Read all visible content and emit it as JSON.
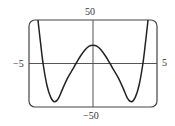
{
  "chart_data": {
    "type": "line",
    "title": "",
    "xlabel": "",
    "ylabel": "",
    "xlim": [
      -5,
      5
    ],
    "ylim": [
      -50,
      50
    ],
    "grid": false,
    "legend": null,
    "tick_labels": {
      "x_min": "−5",
      "x_max": "5",
      "y_max": "50",
      "y_min": "−50"
    },
    "series": [
      {
        "name": "f(x)",
        "description": "Symmetric W-shaped (quartic-like) curve: local max ≈ 21 at x=0, minima ≈ −44 at x≈±3, zeros ≈ ±1.3 and ±3.9, exits top of window near x≈±4.3",
        "x": [
          -4.3,
          -4.1,
          -3.9,
          -3.6,
          -3.3,
          -3.0,
          -2.7,
          -2.4,
          -2.0,
          -1.6,
          -1.33,
          -1.0,
          -0.6,
          -0.3,
          0.0,
          0.3,
          0.6,
          1.0,
          1.33,
          1.6,
          2.0,
          2.4,
          2.7,
          3.0,
          3.3,
          3.6,
          3.9,
          4.1,
          4.3
        ],
        "y": [
          50,
          24,
          0,
          -25,
          -39,
          -44,
          -40,
          -30,
          -17,
          -7,
          0,
          8,
          16,
          20,
          21,
          20,
          16,
          8,
          0,
          -7,
          -17,
          -30,
          -40,
          -44,
          -39,
          -25,
          0,
          24,
          50
        ]
      }
    ]
  },
  "labels": {
    "top": "50",
    "bottom": "−50",
    "left": "−5",
    "right": "5"
  },
  "colors": {
    "curve": "#222222",
    "frame": "#444444",
    "axes": "#555555"
  }
}
